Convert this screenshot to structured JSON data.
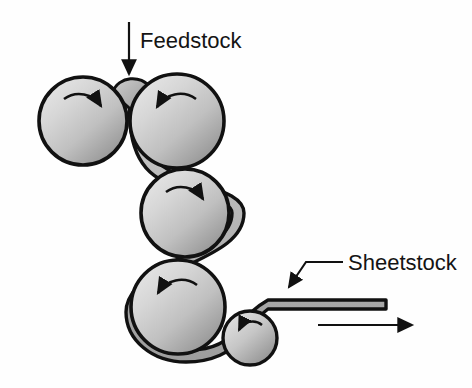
{
  "figure": {
    "type": "process-diagram",
    "background_color": "#fefefe",
    "width": 472,
    "height": 388
  },
  "labels": {
    "feedstock": "Feedstock",
    "sheetstock": "Sheetstock"
  },
  "colors": {
    "roller_light": "#e0e0e0",
    "roller_mid": "#c2c2c2",
    "roller_dark": "#8c8c8c",
    "outline": "#111111",
    "sheet_fill": "#b8b8b8",
    "background": "#fefefe",
    "text": "#141414"
  },
  "rollers": [
    {
      "name": "roller-top-left",
      "index": 1,
      "cx": 83,
      "cy": 121,
      "r": 44,
      "rotation": "clockwise",
      "arrow_label": "rotation-arrow-clockwise"
    },
    {
      "name": "roller-top-right",
      "index": 2,
      "cx": 177,
      "cy": 121,
      "r": 47,
      "rotation": "counter-clockwise",
      "arrow_label": "rotation-arrow-counter-clockwise"
    },
    {
      "name": "roller-middle",
      "index": 3,
      "cx": 185,
      "cy": 213,
      "r": 44,
      "rotation": "clockwise",
      "arrow_label": "rotation-arrow-clockwise"
    },
    {
      "name": "roller-lower",
      "index": 4,
      "cx": 178,
      "cy": 307,
      "r": 47,
      "rotation": "counter-clockwise",
      "arrow_label": "rotation-arrow-counter-clockwise"
    },
    {
      "name": "roller-small-bottom",
      "index": 5,
      "cx": 250,
      "cy": 338,
      "r": 27,
      "rotation": "counter-clockwise",
      "arrow_label": "rotation-arrow-counter-clockwise"
    }
  ],
  "annotations": {
    "feedstock_arrow": {
      "name": "feedstock-arrow",
      "direction": "down",
      "x": 129,
      "y_start": 22,
      "y_end": 80
    },
    "sheetstock_leader": {
      "name": "sheetstock-leader-line",
      "direction": "down-left",
      "points": "340,263 305,263 288,289"
    },
    "exit_arrow": {
      "name": "exit-direction-arrow",
      "direction": "right",
      "x_start": 318,
      "x_end": 418,
      "y": 325
    }
  },
  "sheet": {
    "name": "sheet-material-path",
    "description": "continuous sheet wrapping rollers and exiting right",
    "exit_x_end": 386,
    "exit_y": 300,
    "thickness": 9
  }
}
